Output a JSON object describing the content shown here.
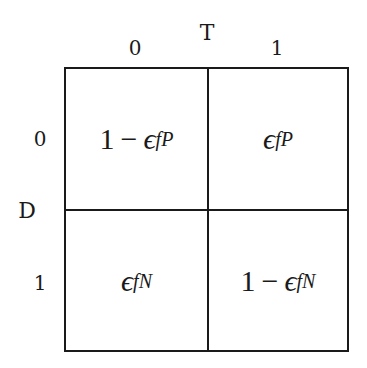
{
  "diagram": {
    "type": "confusion-matrix",
    "column_axis": {
      "title": "T",
      "labels": [
        "0",
        "1"
      ]
    },
    "row_axis": {
      "title": "D",
      "labels": [
        "0",
        "1"
      ]
    },
    "cells": [
      [
        {
          "prefix": "1",
          "operator": "−",
          "symbol": "ϵ",
          "subscript": "fP"
        },
        {
          "prefix": "",
          "operator": "",
          "symbol": "ϵ",
          "subscript": "fP"
        }
      ],
      [
        {
          "prefix": "",
          "operator": "",
          "symbol": "ϵ",
          "subscript": "fN"
        },
        {
          "prefix": "1",
          "operator": "−",
          "symbol": "ϵ",
          "subscript": "fN"
        }
      ]
    ],
    "line_color": "#1a1a1a",
    "background": "#ffffff"
  }
}
